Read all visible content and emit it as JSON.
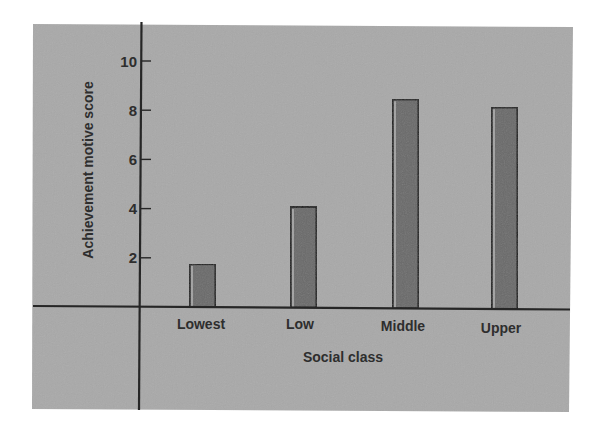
{
  "chart_data": {
    "type": "bar",
    "title": "",
    "xlabel": "Social class",
    "ylabel": "Achievement motive score",
    "categories": [
      "Lowest",
      "Low",
      "Middle",
      "Upper"
    ],
    "values": [
      1.75,
      4.1,
      8.5,
      8.2
    ],
    "ylim": [
      0,
      11
    ],
    "yticks": [
      2,
      4,
      6,
      8,
      10
    ],
    "ytick_labels": [
      "2",
      "4",
      "6",
      "8",
      "10"
    ],
    "grid": false,
    "legend": "none",
    "colors": {
      "panel": "#a9a9a9",
      "bar_fill": "#6b6b6b",
      "bar_edge": "#1e1e1e",
      "bar_highlight": "#d6d6d6",
      "axis": "#262626",
      "text": "#2e2e2e"
    }
  }
}
